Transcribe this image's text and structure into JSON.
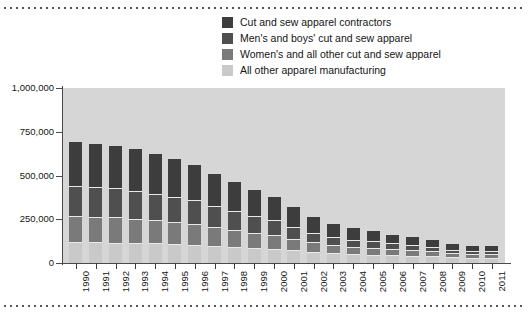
{
  "colors": {
    "contractors": "#3d3d3d",
    "mens_boys": "#4f4f4f",
    "womens_other": "#7a7a7a",
    "all_other": "#c9c9c9",
    "plot_background": "#d6d6d6",
    "axis": "#4a4a4a",
    "text": "#151515"
  },
  "legend": {
    "items": [
      {
        "label": "Cut and sew apparel contractors",
        "color": "#3d3d3d"
      },
      {
        "label": "Men's and boys' cut and sew apparel",
        "color": "#4f4f4f"
      },
      {
        "label": "Women's and all other cut and sew apparel",
        "color": "#7a7a7a"
      },
      {
        "label": "All other apparel manufacturing",
        "color": "#c9c9c9"
      }
    ]
  },
  "axis": {
    "y_ticks": [
      "1,000,000",
      "750,000",
      "500,000",
      "250,000",
      "0"
    ],
    "y_values": [
      1000000,
      750000,
      500000,
      250000,
      0
    ]
  },
  "chart_data": {
    "type": "bar",
    "stacked": true,
    "title": "",
    "subtitle": "",
    "xlabel": "",
    "ylabel": "",
    "ylim": [
      0,
      1000000
    ],
    "grid": false,
    "legend_position": "top",
    "categories": [
      "1990",
      "1991",
      "1992",
      "1993",
      "1994",
      "1995",
      "1996",
      "1997",
      "1998",
      "1999",
      "2000",
      "2001",
      "2002",
      "2003",
      "2004",
      "2005",
      "2006",
      "2007",
      "2008",
      "2009",
      "2010",
      "2011"
    ],
    "series": [
      {
        "name": "All other apparel manufacturing",
        "color": "#c9c9c9",
        "values": [
          120000,
          118000,
          116000,
          114000,
          112000,
          108000,
          104000,
          98000,
          92000,
          86000,
          80000,
          72000,
          62000,
          55000,
          50000,
          47000,
          44000,
          42000,
          38000,
          32000,
          30000,
          29000
        ]
      },
      {
        "name": "Women's and all other cut and sew apparel",
        "color": "#7a7a7a",
        "values": [
          150000,
          147000,
          145000,
          140000,
          133000,
          126000,
          118000,
          108000,
          97000,
          88000,
          80000,
          68000,
          57000,
          48000,
          43000,
          40000,
          36000,
          33000,
          29000,
          24000,
          22000,
          21000
        ]
      },
      {
        "name": "Men's and boys' cut and sew apparel",
        "color": "#4f4f4f",
        "values": [
          170000,
          168000,
          165000,
          160000,
          152000,
          145000,
          136000,
          122000,
          108000,
          95000,
          83000,
          68000,
          55000,
          46000,
          40000,
          36000,
          32000,
          29000,
          25000,
          20000,
          18000,
          17000
        ]
      },
      {
        "name": "Cut and sew apparel contractors",
        "color": "#3d3d3d",
        "values": [
          250000,
          245000,
          245000,
          237000,
          228000,
          218000,
          200000,
          183000,
          165000,
          148000,
          132000,
          110000,
          90000,
          75000,
          65000,
          58000,
          51000,
          46000,
          40000,
          33000,
          30000,
          28000
        ]
      }
    ],
    "totals": [
      690000,
      678000,
      671000,
      651000,
      625000,
      597000,
      558000,
      511000,
      462000,
      417000,
      375000,
      318000,
      264000,
      224000,
      198000,
      181000,
      163000,
      150000,
      132000,
      109000,
      100000,
      95000
    ]
  }
}
